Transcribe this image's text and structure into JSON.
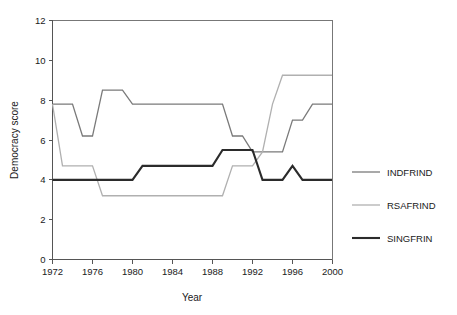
{
  "chart_data": {
    "type": "line",
    "title": "",
    "xlabel": "Year",
    "ylabel": "Democracy score",
    "xlim": [
      1972,
      2000
    ],
    "ylim": [
      0,
      12
    ],
    "xticks": [
      1972,
      1976,
      1980,
      1984,
      1988,
      1992,
      1996,
      2000
    ],
    "yticks": [
      0,
      2,
      4,
      6,
      8,
      10,
      12
    ],
    "xtick_labels": [
      "1972",
      "1976",
      "1980",
      "1984",
      "1988",
      "1992",
      "1996",
      "2000"
    ],
    "ytick_labels": [
      "0",
      "2",
      "4",
      "6",
      "8",
      "10",
      "12"
    ],
    "grid": false,
    "legend_position": "right",
    "x": [
      1972,
      1973,
      1974,
      1975,
      1976,
      1977,
      1978,
      1979,
      1980,
      1981,
      1982,
      1983,
      1984,
      1985,
      1986,
      1987,
      1988,
      1989,
      1990,
      1991,
      1992,
      1993,
      1994,
      1995,
      1996,
      1997,
      1998,
      1999,
      2000
    ],
    "series": [
      {
        "name": "INDFRIND",
        "color": "#7a7a7a",
        "width": 1.3,
        "values": [
          7.8,
          7.8,
          7.8,
          6.2,
          6.2,
          8.5,
          8.5,
          8.5,
          7.8,
          7.8,
          7.8,
          7.8,
          7.8,
          7.8,
          7.8,
          7.8,
          7.8,
          7.8,
          6.2,
          6.2,
          5.4,
          5.4,
          5.4,
          5.4,
          7.0,
          7.0,
          7.8,
          7.8,
          7.8
        ]
      },
      {
        "name": "RSAFRIND",
        "color": "#b0b0b0",
        "width": 1.3,
        "values": [
          7.8,
          4.7,
          4.7,
          4.7,
          4.7,
          3.2,
          3.2,
          3.2,
          3.2,
          3.2,
          3.2,
          3.2,
          3.2,
          3.2,
          3.2,
          3.2,
          3.2,
          3.2,
          4.7,
          4.7,
          4.7,
          5.4,
          7.8,
          9.25,
          9.25,
          9.25,
          9.25,
          9.25,
          9.25
        ]
      },
      {
        "name": "SINGFRIN",
        "color": "#2b2b2b",
        "width": 2.1,
        "values": [
          4.0,
          4.0,
          4.0,
          4.0,
          4.0,
          4.0,
          4.0,
          4.0,
          4.0,
          4.7,
          4.7,
          4.7,
          4.7,
          4.7,
          4.7,
          4.7,
          4.7,
          5.5,
          5.5,
          5.5,
          5.5,
          4.0,
          4.0,
          4.0,
          4.7,
          4.0,
          4.0,
          4.0,
          4.0
        ]
      }
    ]
  },
  "legend": {
    "items": [
      {
        "label": "INDFRIND"
      },
      {
        "label": "RSAFRIND"
      },
      {
        "label": "SINGFRIN"
      }
    ]
  }
}
